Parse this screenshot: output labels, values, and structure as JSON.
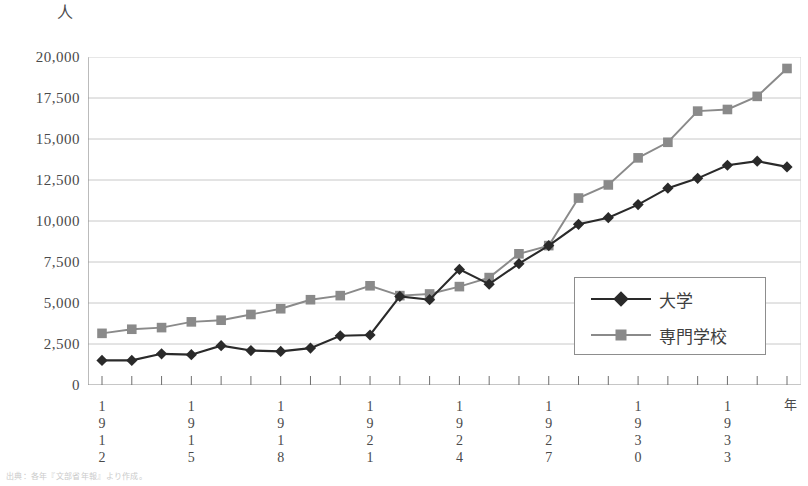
{
  "axes": {
    "unit_label": "人",
    "year_label": "年",
    "y_ticks": [
      "20,000",
      "17,500",
      "15,000",
      "12,500",
      "10,000",
      "7,500",
      "5,000",
      "2,500",
      "0"
    ],
    "x_ticks": [
      "1912",
      "1915",
      "1918",
      "1921",
      "1924",
      "1927",
      "1930",
      "1933"
    ]
  },
  "legend": {
    "items": [
      {
        "label": "大学",
        "marker": "diamond",
        "color": "#2a2a2a"
      },
      {
        "label": "専門学校",
        "marker": "square",
        "color": "#8a8a8a"
      }
    ]
  },
  "caption": "出典：各年『文部省年報』より作成。",
  "chart_data": {
    "type": "line",
    "title": "",
    "xlabel": "年",
    "ylabel": "人",
    "ylim": [
      0,
      20000
    ],
    "ytick_step": 2500,
    "grid": true,
    "legend_position": "bottom-right",
    "x": [
      1912,
      1913,
      1914,
      1915,
      1916,
      1917,
      1918,
      1919,
      1920,
      1921,
      1922,
      1923,
      1924,
      1925,
      1926,
      1927,
      1928,
      1929,
      1930,
      1931,
      1932,
      1933,
      1934,
      1935
    ],
    "series": [
      {
        "name": "大学",
        "marker": "diamond",
        "color": "#2a2a2a",
        "values": [
          1500,
          1500,
          1900,
          1850,
          2400,
          2100,
          2050,
          2250,
          3000,
          3050,
          5400,
          5200,
          7050,
          6150,
          7400,
          8500,
          9800,
          10200,
          11000,
          12000,
          12600,
          13400,
          13650,
          13300
        ]
      },
      {
        "name": "専門学校",
        "marker": "square",
        "color": "#8a8a8a",
        "values": [
          3150,
          3400,
          3500,
          3850,
          3950,
          4300,
          4650,
          5200,
          5450,
          6050,
          5450,
          5550,
          6000,
          6550,
          8000,
          8500,
          11400,
          12200,
          13850,
          14800,
          16700,
          16800,
          17600,
          19300
        ]
      }
    ]
  }
}
